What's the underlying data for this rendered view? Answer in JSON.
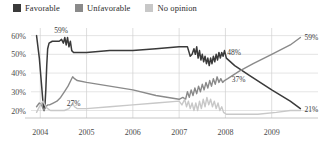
{
  "legend": {
    "position": "top-left",
    "items": [
      {
        "label": "Favorable",
        "color": "#3a3a3a",
        "icon": "legend-swatch-icon"
      },
      {
        "label": "Unfavorable",
        "color": "#8a8a8a",
        "icon": "legend-swatch-icon"
      },
      {
        "label": "No opinion",
        "color": "#c8c8c8",
        "icon": "legend-swatch-icon"
      }
    ]
  },
  "chart_data": {
    "type": "line",
    "title": "",
    "subtitle": "",
    "xlabel": "",
    "ylabel": "",
    "xlim": [
      2003.8,
      2010.0
    ],
    "ylim": [
      16,
      63
    ],
    "grid": true,
    "legend_position": "top-left",
    "x_ticks": [
      "2004",
      "2005",
      "2006",
      "2007",
      "2008",
      "2009"
    ],
    "x_tick_values": [
      2004,
      2005,
      2006,
      2007,
      2008,
      2009
    ],
    "y_ticks": [
      "20%",
      "30%",
      "40%",
      "50%",
      "60%"
    ],
    "y_tick_values": [
      20,
      30,
      40,
      50,
      60
    ],
    "annotations": [
      {
        "text": "59%",
        "x": 2004.45,
        "y": 59,
        "series": "Favorable",
        "placement": "above"
      },
      {
        "text": "27%",
        "x": 2004.72,
        "y": 27,
        "series": "No opinion",
        "placement": "below"
      },
      {
        "text": "48%",
        "x": 2008.02,
        "y": 48,
        "series": "Favorable",
        "placement": "above-right"
      },
      {
        "text": "37%",
        "x": 2008.05,
        "y": 37,
        "series": "Unfavorable",
        "placement": "right"
      },
      {
        "text": "59%",
        "x": 2009.62,
        "y": 59,
        "series": "Unfavorable",
        "placement": "right"
      },
      {
        "text": "21%",
        "x": 2009.62,
        "y": 21,
        "series": "Favorable",
        "placement": "right"
      }
    ],
    "series": [
      {
        "name": "Favorable",
        "color": "#3a3a3a",
        "width": 1.5,
        "points": [
          [
            2003.92,
            60
          ],
          [
            2003.98,
            48
          ],
          [
            2004.03,
            33
          ],
          [
            2004.06,
            24
          ],
          [
            2004.08,
            20
          ],
          [
            2004.1,
            22
          ],
          [
            2004.12,
            31
          ],
          [
            2004.14,
            44
          ],
          [
            2004.16,
            53
          ],
          [
            2004.19,
            56
          ],
          [
            2004.26,
            57
          ],
          [
            2004.34,
            57
          ],
          [
            2004.41,
            57
          ],
          [
            2004.46,
            58
          ],
          [
            2004.5,
            56
          ],
          [
            2004.53,
            59
          ],
          [
            2004.56,
            55
          ],
          [
            2004.59,
            59
          ],
          [
            2004.62,
            54
          ],
          [
            2004.65,
            57
          ],
          [
            2004.68,
            52
          ],
          [
            2004.72,
            51
          ],
          [
            2004.8,
            51
          ],
          [
            2005.0,
            51
          ],
          [
            2005.5,
            52
          ],
          [
            2006.0,
            52
          ],
          [
            2006.5,
            53
          ],
          [
            2007.0,
            54
          ],
          [
            2007.1,
            54
          ],
          [
            2007.18,
            54
          ],
          [
            2007.24,
            49
          ],
          [
            2007.28,
            50
          ],
          [
            2007.32,
            53
          ],
          [
            2007.35,
            50
          ],
          [
            2007.38,
            54
          ],
          [
            2007.41,
            48
          ],
          [
            2007.44,
            52
          ],
          [
            2007.47,
            47
          ],
          [
            2007.5,
            50
          ],
          [
            2007.53,
            46
          ],
          [
            2007.56,
            49
          ],
          [
            2007.59,
            45
          ],
          [
            2007.62,
            48
          ],
          [
            2007.65,
            44
          ],
          [
            2007.68,
            48
          ],
          [
            2007.71,
            45
          ],
          [
            2007.74,
            49
          ],
          [
            2007.77,
            46
          ],
          [
            2007.8,
            50
          ],
          [
            2007.83,
            47
          ],
          [
            2007.86,
            51
          ],
          [
            2007.89,
            48
          ],
          [
            2007.92,
            51
          ],
          [
            2007.95,
            49
          ],
          [
            2007.98,
            52
          ],
          [
            2008.02,
            48
          ],
          [
            2008.2,
            44
          ],
          [
            2008.5,
            39
          ],
          [
            2009.0,
            31
          ],
          [
            2009.4,
            25
          ],
          [
            2009.62,
            21
          ]
        ]
      },
      {
        "name": "Unfavorable",
        "color": "#8a8a8a",
        "width": 1.4,
        "points": [
          [
            2003.92,
            22
          ],
          [
            2003.98,
            24
          ],
          [
            2004.03,
            23
          ],
          [
            2004.06,
            21
          ],
          [
            2004.08,
            20
          ],
          [
            2004.12,
            22
          ],
          [
            2004.16,
            23
          ],
          [
            2004.2,
            23
          ],
          [
            2004.28,
            24
          ],
          [
            2004.36,
            25
          ],
          [
            2004.44,
            27
          ],
          [
            2004.52,
            30
          ],
          [
            2004.6,
            33
          ],
          [
            2004.66,
            36
          ],
          [
            2004.7,
            38
          ],
          [
            2004.74,
            37
          ],
          [
            2004.8,
            36
          ],
          [
            2005.0,
            35
          ],
          [
            2005.5,
            33
          ],
          [
            2006.0,
            31
          ],
          [
            2006.5,
            28
          ],
          [
            2007.0,
            26
          ],
          [
            2007.08,
            27
          ],
          [
            2007.14,
            26
          ],
          [
            2007.18,
            30
          ],
          [
            2007.22,
            27
          ],
          [
            2007.26,
            31
          ],
          [
            2007.3,
            28
          ],
          [
            2007.34,
            32
          ],
          [
            2007.38,
            29
          ],
          [
            2007.42,
            33
          ],
          [
            2007.46,
            30
          ],
          [
            2007.5,
            34
          ],
          [
            2007.54,
            31
          ],
          [
            2007.58,
            35
          ],
          [
            2007.62,
            32
          ],
          [
            2007.66,
            36
          ],
          [
            2007.7,
            33
          ],
          [
            2007.74,
            37
          ],
          [
            2007.78,
            34
          ],
          [
            2007.82,
            38
          ],
          [
            2007.86,
            35
          ],
          [
            2007.9,
            37
          ],
          [
            2007.94,
            35
          ],
          [
            2007.98,
            36
          ],
          [
            2008.05,
            37
          ],
          [
            2008.3,
            41
          ],
          [
            2008.6,
            45
          ],
          [
            2009.0,
            50
          ],
          [
            2009.4,
            55
          ],
          [
            2009.62,
            59
          ]
        ]
      },
      {
        "name": "No opinion",
        "color": "#c8c8c8",
        "width": 1.4,
        "points": [
          [
            2003.92,
            19
          ],
          [
            2003.98,
            22
          ],
          [
            2004.03,
            24
          ],
          [
            2004.06,
            25
          ],
          [
            2004.08,
            24
          ],
          [
            2004.12,
            22
          ],
          [
            2004.16,
            21
          ],
          [
            2004.22,
            20
          ],
          [
            2004.3,
            20
          ],
          [
            2004.4,
            20
          ],
          [
            2004.52,
            20
          ],
          [
            2004.62,
            21
          ],
          [
            2004.7,
            24
          ],
          [
            2004.74,
            22
          ],
          [
            2004.8,
            21
          ],
          [
            2005.0,
            21
          ],
          [
            2005.5,
            22
          ],
          [
            2006.0,
            23
          ],
          [
            2006.5,
            24
          ],
          [
            2007.0,
            25
          ],
          [
            2007.06,
            23
          ],
          [
            2007.12,
            26
          ],
          [
            2007.16,
            22
          ],
          [
            2007.2,
            25
          ],
          [
            2007.24,
            21
          ],
          [
            2007.28,
            24
          ],
          [
            2007.32,
            20
          ],
          [
            2007.36,
            24
          ],
          [
            2007.4,
            20
          ],
          [
            2007.44,
            25
          ],
          [
            2007.48,
            21
          ],
          [
            2007.52,
            26
          ],
          [
            2007.56,
            22
          ],
          [
            2007.6,
            27
          ],
          [
            2007.64,
            23
          ],
          [
            2007.68,
            26
          ],
          [
            2007.72,
            22
          ],
          [
            2007.76,
            25
          ],
          [
            2007.8,
            21
          ],
          [
            2007.84,
            24
          ],
          [
            2007.88,
            20
          ],
          [
            2007.92,
            22
          ],
          [
            2007.96,
            19
          ],
          [
            2008.02,
            18
          ],
          [
            2008.3,
            18
          ],
          [
            2008.7,
            18
          ],
          [
            2009.1,
            19
          ],
          [
            2009.4,
            20
          ],
          [
            2009.62,
            20
          ]
        ]
      }
    ]
  }
}
